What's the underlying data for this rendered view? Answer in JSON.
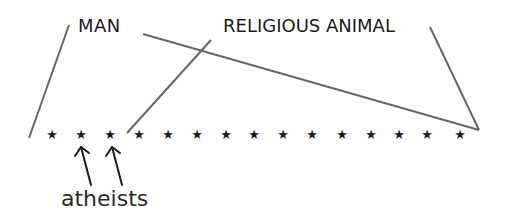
{
  "diagram": {
    "labels": {
      "man": "MAN",
      "religious_animal": "RELIGIOUS ANIMAL",
      "atheists": "atheists"
    },
    "star_glyph": "★",
    "star_count": 15,
    "stars_x": [
      52,
      81,
      110,
      139,
      168,
      197,
      226,
      254,
      283,
      312,
      342,
      371,
      399,
      427,
      460
    ],
    "stars_y": 134,
    "atheist_star_indices": [
      1,
      2
    ],
    "colors": {
      "line": "#666666",
      "text": "#1a1a1a",
      "background": "#ffffff"
    }
  }
}
